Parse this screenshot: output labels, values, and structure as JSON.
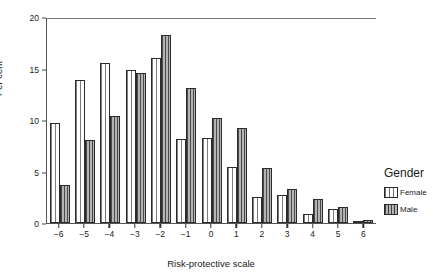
{
  "chart_data": {
    "type": "bar",
    "title": "",
    "subtitle": "",
    "xlabel": "Risk-protective scale",
    "ylabel": "Per cent",
    "categories": [
      "-6",
      "-5",
      "-4",
      "-3",
      "-2",
      "-1",
      "0",
      "1",
      "2",
      "3",
      "4",
      "5",
      "6"
    ],
    "xticklabels": [
      "−6",
      "−5",
      "−4",
      "−3",
      "−2",
      "−1",
      "0",
      "1",
      "2",
      "3",
      "4",
      "5",
      "6"
    ],
    "yticklabels": [
      "20",
      "15",
      "10",
      "5",
      "0"
    ],
    "yticks": [
      20,
      15,
      10,
      5,
      0
    ],
    "ylim": [
      0,
      20
    ],
    "grid": false,
    "legend_position": "right",
    "legend_title": "Gender",
    "series": [
      {
        "name": "Female",
        "values": [
          9.7,
          13.9,
          15.5,
          14.9,
          16.0,
          8.2,
          8.3,
          5.4,
          2.5,
          2.7,
          0.9,
          1.4,
          0.2
        ]
      },
      {
        "name": "Male",
        "values": [
          3.7,
          8.1,
          10.4,
          14.6,
          18.3,
          13.1,
          10.2,
          9.2,
          5.3,
          3.3,
          2.3,
          1.6,
          0.3
        ]
      }
    ]
  },
  "legend": {
    "title": "Gender",
    "entries": [
      {
        "label": "Female",
        "swatch": "female-hatch-swatch"
      },
      {
        "label": "Male",
        "swatch": "male-hatch-swatch"
      }
    ]
  },
  "colors": {
    "female_fill": "#ffffff",
    "female_hatch": "#7d7d7d",
    "male_fill": "#9a9a9a",
    "male_hatch": "#4a4a4a",
    "bar_outline": "#2b2b2b",
    "axis": "#555555",
    "text": "#1a1a1a"
  }
}
